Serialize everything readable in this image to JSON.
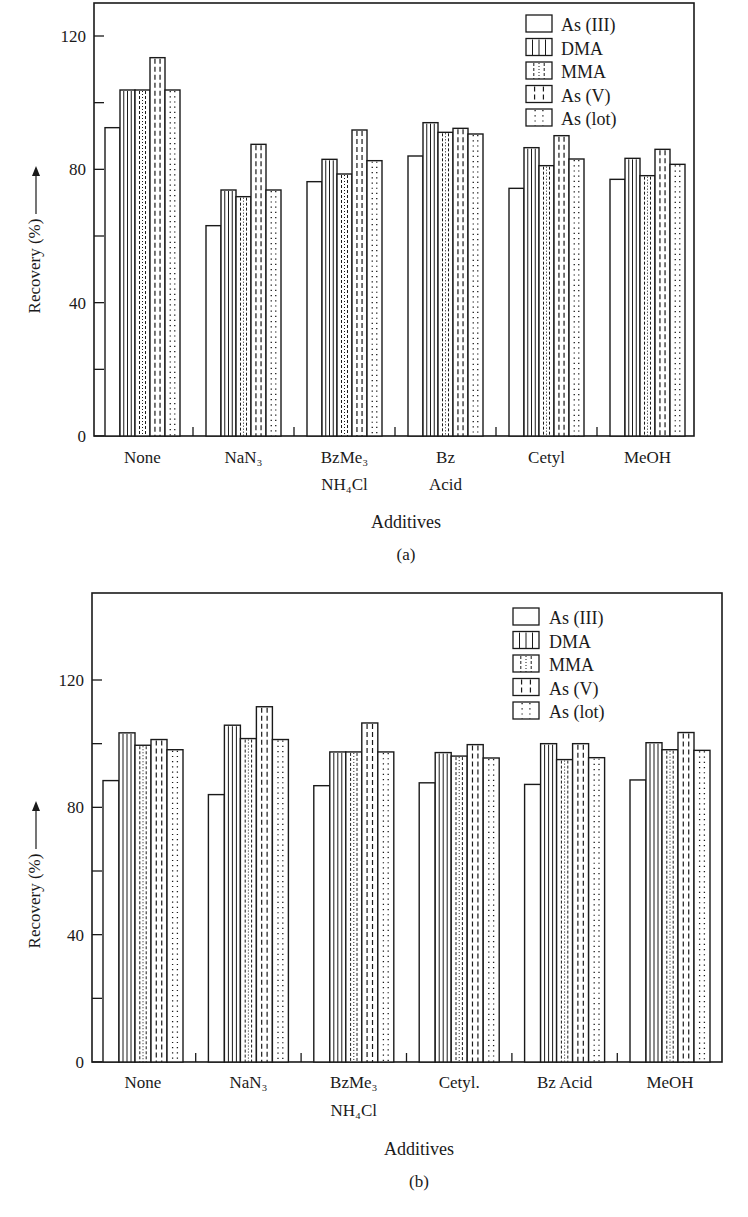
{
  "chart_data": [
    {
      "id": "a",
      "panel_label": "(a)",
      "type": "bar",
      "title": "",
      "xlabel": "Additives",
      "ylabel": "Recovery (%)",
      "ylabel_arrow": true,
      "ylim": [
        0,
        130
      ],
      "yticks_labeled": [
        0,
        40,
        80,
        120
      ],
      "yticks_minor": [
        20,
        60,
        100
      ],
      "grid": false,
      "legend_position": "upper right (inside)",
      "categories": [
        {
          "label": "None",
          "sub": ""
        },
        {
          "label": "NaN₃",
          "sub": ""
        },
        {
          "label": "BzMe₃",
          "sub": "NH₄Cl"
        },
        {
          "label": "Bz",
          "sub": "Acid"
        },
        {
          "label": "Cetyl",
          "sub": ""
        },
        {
          "label": "MeOH",
          "sub": ""
        }
      ],
      "series": [
        {
          "name": "As (III)",
          "pattern": "blank",
          "values": [
            92.5,
            63.1,
            76.3,
            84.0,
            74.3,
            77.0
          ]
        },
        {
          "name": "DMA",
          "pattern": "solid",
          "values": [
            103.8,
            73.8,
            83.0,
            94.0,
            86.5,
            83.3
          ]
        },
        {
          "name": "MMA",
          "pattern": "mixed",
          "values": [
            103.8,
            71.8,
            78.6,
            91.1,
            81.1,
            78.1
          ]
        },
        {
          "name": "As (V)",
          "pattern": "dashed",
          "values": [
            113.5,
            87.5,
            91.8,
            92.3,
            90.1,
            86.0
          ]
        },
        {
          "name": "As (lot)",
          "pattern": "dotted",
          "values": [
            103.8,
            73.8,
            82.6,
            90.6,
            83.1,
            81.5
          ]
        }
      ]
    },
    {
      "id": "b",
      "panel_label": "(b)",
      "type": "bar",
      "title": "",
      "xlabel": "Additives",
      "ylabel": "Recovery (%)",
      "ylabel_arrow": true,
      "ylim": [
        0,
        147
      ],
      "yticks_labeled": [
        0,
        40,
        80,
        120
      ],
      "yticks_minor": [
        20,
        60,
        100
      ],
      "grid": false,
      "legend_position": "upper right (inside)",
      "categories": [
        {
          "label": "None",
          "sub": ""
        },
        {
          "label": "NaN₃",
          "sub": ""
        },
        {
          "label": "BzMe₃",
          "sub": "NH₄Cl"
        },
        {
          "label": "Cetyl.",
          "sub": ""
        },
        {
          "label": "Bz Acid",
          "sub": ""
        },
        {
          "label": "MeOH",
          "sub": ""
        }
      ],
      "series": [
        {
          "name": "As (III)",
          "pattern": "blank",
          "values": [
            88.4,
            84.0,
            86.8,
            87.7,
            87.2,
            88.6
          ]
        },
        {
          "name": "DMA",
          "pattern": "solid",
          "values": [
            103.4,
            105.8,
            97.4,
            97.2,
            100.0,
            100.3
          ]
        },
        {
          "name": "MMA",
          "pattern": "mixed",
          "values": [
            99.5,
            101.6,
            97.4,
            96.1,
            95.0,
            98.1
          ]
        },
        {
          "name": "As (V)",
          "pattern": "dashed",
          "values": [
            101.3,
            111.6,
            106.5,
            99.7,
            100.0,
            103.5
          ]
        },
        {
          "name": "As (lot)",
          "pattern": "dotted",
          "values": [
            98.1,
            101.3,
            97.4,
            95.5,
            95.6,
            97.9
          ]
        }
      ]
    }
  ],
  "layout": {
    "a": {
      "box": [
        94,
        3,
        694,
        436
      ],
      "y0px": 436,
      "y120px": 36,
      "group_start": 105,
      "group_period": 101,
      "bar_w": 15,
      "legend": {
        "x": 526,
        "y": 15,
        "row": 23.5,
        "sw_w": 26,
        "sw_h": 17,
        "text_x": 561
      },
      "xlabel_y": 528,
      "panel_y": 560,
      "cat_y": 463,
      "cat_sub_y": 490,
      "ylabel_x": 40
    },
    "b": {
      "box": [
        92,
        3,
        722,
        472
      ],
      "y0px": 472,
      "y120px": 90,
      "group_start": 103,
      "group_period": 105.4,
      "bar_w": 16,
      "legend": {
        "x": 513,
        "y": 18,
        "row": 23.5,
        "sw_w": 26,
        "sw_h": 17,
        "text_x": 549
      },
      "xlabel_y": 565,
      "panel_y": 597,
      "cat_y": 498,
      "cat_sub_y": 526,
      "ylabel_x": 40
    }
  }
}
